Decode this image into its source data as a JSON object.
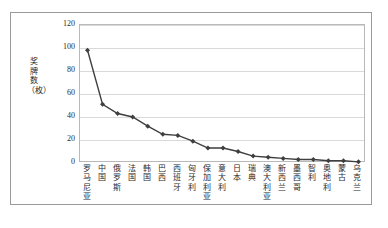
{
  "chart_data": {
    "type": "line",
    "title": "",
    "xlabel": "",
    "ylabel": "奖牌数（枚）",
    "ylim": [
      0,
      120
    ],
    "yticks": [
      "0",
      "20",
      "40",
      "60",
      "80",
      "100",
      "120"
    ],
    "grid": true,
    "legend": "none",
    "marker": "diamond",
    "line_color": "#3f3f3f",
    "marker_color": "#3f3f3f",
    "grid_color": "#d9d9d9",
    "categories": [
      "罗马尼亚",
      "中国",
      "俄罗斯",
      "法国",
      "韩国",
      "巴西",
      "西班牙",
      "匈牙利",
      "保加利亚",
      "意大利",
      "日本",
      "瑞典",
      "澳大利亚",
      "新西兰",
      "墨西哥",
      "智利",
      "奥地利",
      "蒙古",
      "乌克兰"
    ],
    "values": [
      98,
      51,
      43,
      40,
      32,
      25,
      24,
      19,
      13,
      13,
      10,
      6,
      5,
      4,
      3,
      3,
      2,
      2,
      1
    ]
  }
}
